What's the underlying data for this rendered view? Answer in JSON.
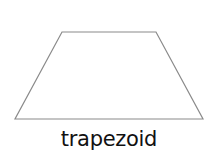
{
  "diagram": {
    "shape_name": "trapezoid",
    "label": "trapezoid",
    "stroke_color": "#8a8a8a",
    "fill_color": "#ffffff",
    "vertices": [
      [
        62,
        32
      ],
      [
        156,
        32
      ],
      [
        203,
        119
      ],
      [
        15,
        119
      ]
    ]
  }
}
